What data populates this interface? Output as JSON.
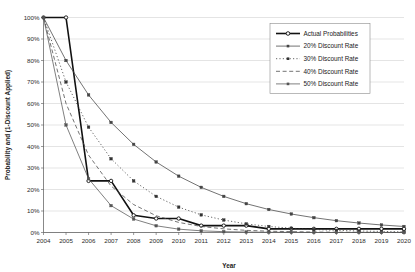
{
  "chart_data": {
    "type": "line",
    "title": "",
    "xlabel": "Year",
    "ylabel": "Probability and (1-Discount Applied)",
    "categories": [
      "2004",
      "2005",
      "2006",
      "2007",
      "2008",
      "2009",
      "2010",
      "2011",
      "2012",
      "2013",
      "2014",
      "2015",
      "2016",
      "2017",
      "2018",
      "2019",
      "2020"
    ],
    "x": [
      2004,
      2005,
      2006,
      2007,
      2008,
      2009,
      2010,
      2011,
      2012,
      2013,
      2014,
      2015,
      2016,
      2017,
      2018,
      2019,
      2020
    ],
    "xlim": [
      2004,
      2020
    ],
    "ylim": [
      0,
      100
    ],
    "y_tick_labels": [
      "0%",
      "10%",
      "20%",
      "30%",
      "40%",
      "50%",
      "60%",
      "70%",
      "80%",
      "90%",
      "100%"
    ],
    "y_tick_values": [
      0,
      10,
      20,
      30,
      40,
      50,
      60,
      70,
      80,
      90,
      100
    ],
    "grid": "horizontal",
    "legend_position": "top-right",
    "series": [
      {
        "name": "Actual Probabilities",
        "style": "solid-thick",
        "marker": "open-circle",
        "color": "#111111",
        "values": [
          100,
          100,
          24,
          24,
          8,
          6.5,
          6.5,
          3.2,
          3.2,
          3.2,
          1.7,
          1.7,
          1.7,
          1.7,
          1.7,
          1.7,
          1.7
        ]
      },
      {
        "name": "20% Discount Rate",
        "style": "solid-thin",
        "marker": "square",
        "color": "#444444",
        "values": [
          100,
          80,
          64,
          51.2,
          41,
          32.8,
          26.2,
          21,
          16.8,
          13.4,
          10.7,
          8.6,
          6.9,
          5.5,
          4.4,
          3.5,
          2.8
        ]
      },
      {
        "name": "30% Discount Rate",
        "style": "dotted",
        "marker": "square",
        "color": "#333333",
        "values": [
          100,
          70,
          49,
          34.3,
          24,
          16.8,
          11.8,
          8.2,
          5.8,
          4.0,
          2.8,
          2.0,
          1.4,
          1.0,
          0.7,
          0.5,
          0.3
        ]
      },
      {
        "name": "40% Discount Rate",
        "style": "dashed",
        "marker": "none",
        "color": "#444444",
        "values": [
          100,
          60,
          36,
          21.6,
          13,
          7.8,
          4.7,
          2.8,
          1.7,
          1.0,
          0.6,
          0.4,
          0.2,
          0.13,
          0.08,
          0.05,
          0.03
        ]
      },
      {
        "name": "50% Discount Rate",
        "style": "solid-thin",
        "marker": "square",
        "color": "#555555",
        "values": [
          100,
          50,
          25,
          12.5,
          6.25,
          3.13,
          1.56,
          0.78,
          0.39,
          0.2,
          0.1,
          0.05,
          0.02,
          0.01,
          0.01,
          0.0,
          0.0
        ]
      }
    ]
  },
  "legend": {
    "entries": [
      {
        "label": "Actual Probabilities"
      },
      {
        "label": "20% Discount Rate"
      },
      {
        "label": "30% Discount Rate"
      },
      {
        "label": "40% Discount Rate"
      },
      {
        "label": "50% Discount Rate"
      }
    ]
  }
}
